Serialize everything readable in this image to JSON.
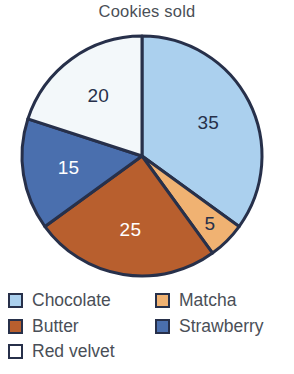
{
  "chart_data": {
    "type": "pie",
    "title": "Cookies sold",
    "categories": [
      "Chocolate",
      "Matcha",
      "Butter",
      "Strawberry",
      "Red velvet"
    ],
    "values": [
      35,
      5,
      25,
      15,
      20
    ],
    "value_labels": [
      "35",
      "5",
      "25",
      "15",
      "20"
    ],
    "colors": [
      "#abd0ee",
      "#f0b272",
      "#b85f2e",
      "#4a6fae",
      "#f3f8fa"
    ],
    "label_colors": [
      "#27304a",
      "#27304a",
      "#ffffff",
      "#ffffff",
      "#27304a"
    ],
    "total": 100,
    "start_angle_deg": 0,
    "direction": "clockwise",
    "stroke_color": "#27304a",
    "legend_position": "bottom",
    "legend_columns": 2,
    "xlabel": "",
    "ylabel": ""
  },
  "legend": {
    "rows": [
      {
        "left": {
          "label": "Chocolate",
          "color": "#abd0ee",
          "name": "legend-item-chocolate"
        },
        "right": {
          "label": "Matcha",
          "color": "#f0b272",
          "name": "legend-item-matcha"
        }
      },
      {
        "left": {
          "label": "Butter",
          "color": "#b85f2e",
          "name": "legend-item-butter"
        },
        "right": {
          "label": "Strawberry",
          "color": "#4a6fae",
          "name": "legend-item-strawberry"
        }
      },
      {
        "left": {
          "label": "Red velvet",
          "color": "#ffffff",
          "name": "legend-item-red-velvet"
        },
        "right": null
      }
    ]
  }
}
